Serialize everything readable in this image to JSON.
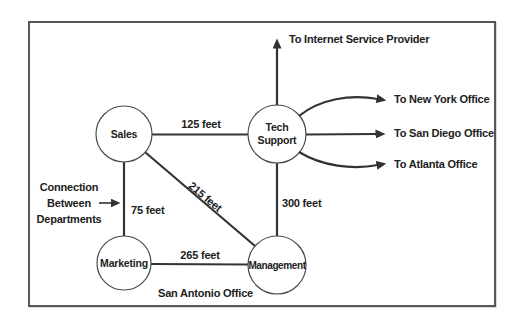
{
  "nodes": {
    "sales": {
      "label": "Sales"
    },
    "tech_support": {
      "label": "Tech Support"
    },
    "marketing": {
      "label": "Marketing"
    },
    "management": {
      "label": "Management"
    }
  },
  "edges": {
    "sales_tech_support": {
      "label": "125 feet"
    },
    "sales_marketing": {
      "label": "75 feet"
    },
    "sales_management": {
      "label": "215 feet"
    },
    "marketing_management": {
      "label": "265 feet"
    },
    "tech_support_management": {
      "label": "300 feet"
    }
  },
  "external_links": {
    "internet_service_provider": {
      "label": "To Internet Service Provider"
    },
    "new_york_office": {
      "label": "To New York Office"
    },
    "san_diego_office": {
      "label": "To San Diego Office"
    },
    "atlanta_office": {
      "label": "To Atlanta Office"
    }
  },
  "annotation": {
    "line1": "Connection",
    "line2": "Between",
    "line3": "Departments"
  },
  "footer": {
    "region_label": "San Antonio Office"
  },
  "colors": {
    "line": "#333333",
    "circle_stroke": "#4a4a4a",
    "text": "#212121",
    "border": "#565656",
    "background": "#ffffff"
  }
}
